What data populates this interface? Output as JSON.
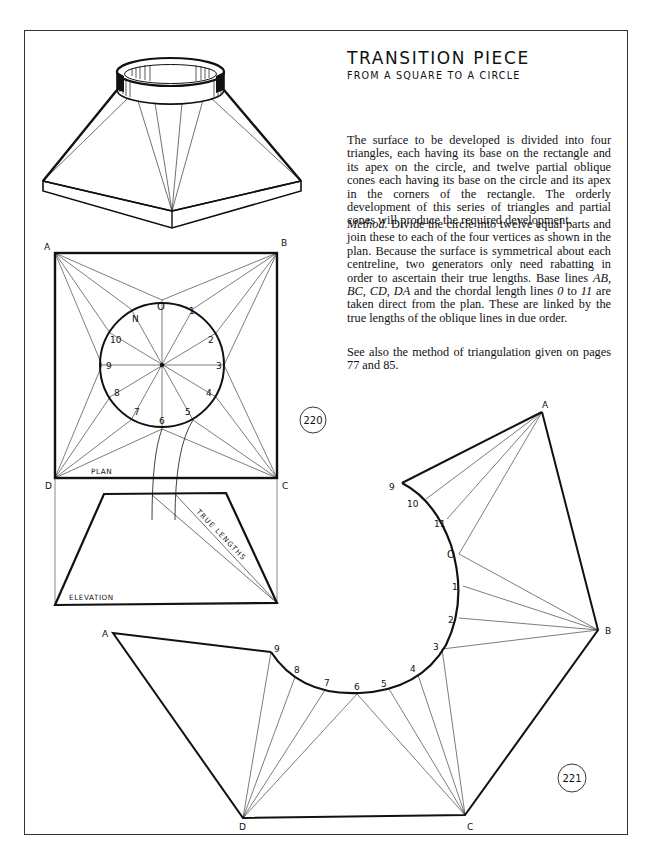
{
  "page": {
    "title": "TRANSITION PIECE",
    "subtitle": "FROM A SQUARE TO A CIRCLE",
    "paragraphs": {
      "intro": "The surface to be developed is divided into four triangles, each having its base on the rectangle and its apex on the circle, and twelve partial oblique cones each having its base on the circle and its apex in the corners of the rectangle. The orderly development of this series of triangles and partial cones will produce the required development.",
      "method_label": "Method.",
      "method_part1": " Divide the circle into twelve equal parts and join these to each of the four vertices as shown in the plan. Because the surface is symmetrical about each centreline, two generators only need rabatting in order to ascertain their true lengths. Base lines ",
      "method_ab": "AB",
      "method_sep1": ", ",
      "method_bc": "BC",
      "method_sep2": ", ",
      "method_cd": "CD",
      "method_sep3": ", ",
      "method_da": "DA",
      "method_part2": " and the chordal length lines ",
      "method_0": "0",
      "method_to": " to ",
      "method_11": "11",
      "method_part3": " are taken direct from the plan. These are linked by the true lengths of the oblique lines in due order.",
      "see_also": "See also the method of triangulation given on pages 77 and 85."
    }
  },
  "figures": {
    "fig220": {
      "number": "220",
      "plan_label": "PLAN",
      "elevation_label": "ELEVATION",
      "true_lengths_label": "TRUE LENGTHS",
      "corners": {
        "a": "A",
        "b": "B",
        "c": "C",
        "d": "D"
      },
      "circle_points": [
        "O",
        "1",
        "2",
        "3",
        "4",
        "5",
        "6",
        "7",
        "8",
        "9",
        "10",
        "N"
      ]
    },
    "fig221": {
      "number": "221",
      "corners": {
        "a_top": "A",
        "b": "B",
        "c": "C",
        "d": "D",
        "a_left": "A"
      },
      "arc_points_upper": [
        "9",
        "10",
        "11",
        "O",
        "1",
        "2",
        "3"
      ],
      "arc_points_lower": [
        "3",
        "4",
        "5",
        "6",
        "7",
        "8",
        "9"
      ]
    }
  }
}
